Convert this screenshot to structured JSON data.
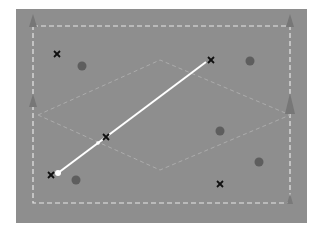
{
  "board": {
    "background": "#8e8e8e",
    "boundary_color": "#e6e6e6",
    "diamond_color": "#b0b0b0",
    "marker_x_color": "#111111",
    "dot_color": "#5e5e5e",
    "arrow_color": "#767676",
    "path_color": "#ffffff"
  },
  "markers_x": [
    {
      "x": 57,
      "y": 54
    },
    {
      "x": 211,
      "y": 60
    },
    {
      "x": 106,
      "y": 137
    },
    {
      "x": 51,
      "y": 175
    },
    {
      "x": 220,
      "y": 184
    }
  ],
  "dots": [
    {
      "x": 82,
      "y": 66
    },
    {
      "x": 250,
      "y": 61
    },
    {
      "x": 220,
      "y": 131
    },
    {
      "x": 259,
      "y": 162
    },
    {
      "x": 76,
      "y": 180
    }
  ],
  "path": {
    "x1": 58,
    "y1": 173,
    "x2": 206,
    "y2": 62,
    "mid_x": 98,
    "mid_y": 143
  }
}
